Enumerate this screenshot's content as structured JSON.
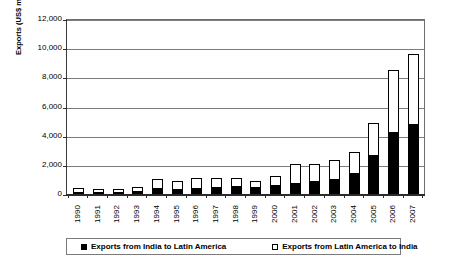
{
  "chart_data": {
    "type": "bar",
    "stacked": true,
    "title": "",
    "xlabel": "",
    "ylabel": "Exports (US$ million)",
    "ylim": [
      0,
      12000
    ],
    "ytick_values": [
      0,
      2000,
      4000,
      6000,
      8000,
      10000,
      12000
    ],
    "ytick_labels": [
      "0",
      "2,000",
      "4,000",
      "6,000",
      "8,000",
      "10,000",
      "12,000"
    ],
    "grid": true,
    "legend_position": "bottom",
    "categories": [
      "1990",
      "1991",
      "1992",
      "1993",
      "1994",
      "1995",
      "1996",
      "1997",
      "1998",
      "1999",
      "2000",
      "2001",
      "2002",
      "2003",
      "2004",
      "2005",
      "2006",
      "2007"
    ],
    "series": [
      {
        "name": "Exports from India to Latin America",
        "color": "#000000",
        "values": [
          60,
          90,
          120,
          200,
          380,
          330,
          420,
          480,
          520,
          450,
          620,
          780,
          880,
          1050,
          1450,
          2650,
          4250,
          4800
        ]
      },
      {
        "name": "Exports from Latin America to India",
        "color": "#ffffff",
        "values": [
          290,
          200,
          180,
          250,
          620,
          560,
          700,
          620,
          580,
          420,
          620,
          1300,
          1200,
          1300,
          1450,
          2250,
          4250,
          4800
        ]
      }
    ],
    "totals": [
      350,
      290,
      300,
      450,
      1000,
      890,
      1120,
      1100,
      1100,
      870,
      1240,
      2080,
      2080,
      2350,
      2900,
      4900,
      8500,
      9600
    ]
  },
  "legend": {
    "items": [
      {
        "label": "Exports from India to Latin America",
        "swatch": "filled-square-icon"
      },
      {
        "label": "Exports from Latin America to India",
        "swatch": "empty-square-icon"
      }
    ]
  }
}
